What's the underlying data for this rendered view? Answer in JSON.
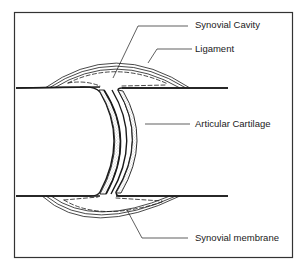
{
  "diagram": {
    "labels": [
      {
        "id": "synovial-cavity",
        "text": "Synovial Cavity"
      },
      {
        "id": "ligament",
        "text": "Ligament"
      },
      {
        "id": "articular-cartilage",
        "text": "Articular Cartilage"
      },
      {
        "id": "synovial-membrane",
        "text": "Synovial membrane"
      }
    ],
    "colors": {
      "line": "#1a1a1a",
      "background": "#ffffff",
      "stipple": "#8a8a8a"
    }
  }
}
